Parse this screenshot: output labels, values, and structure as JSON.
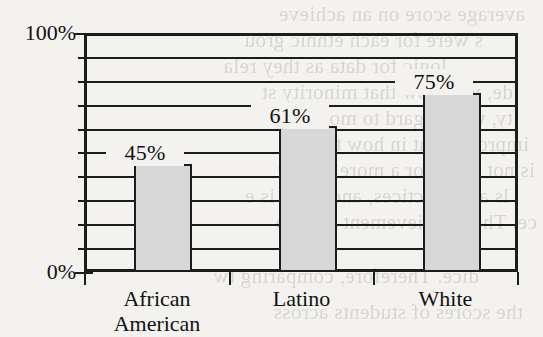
{
  "chart_data": {
    "type": "bar",
    "title": "",
    "subtitle": "",
    "xlabel": "",
    "ylabel": "",
    "categories": [
      "African American",
      "Latino",
      "White"
    ],
    "category_lines": [
      [
        "African",
        "American"
      ],
      [
        "Latino"
      ],
      [
        "White"
      ]
    ],
    "values": [
      45,
      61,
      75
    ],
    "value_labels": [
      "45%",
      "61%",
      "75%"
    ],
    "ylim": [
      0,
      100
    ],
    "ytick_values": [
      0,
      10,
      20,
      30,
      40,
      50,
      60,
      70,
      80,
      90,
      100
    ],
    "ytick_labels_shown": [
      "0%",
      "100%"
    ],
    "y_axis_min_label": "0%",
    "y_axis_max_label": "100%",
    "grid": true,
    "grid_orientation": "horizontal",
    "legend": null,
    "legend_position": "none",
    "series": [
      {
        "name": "Percent",
        "values": [
          45,
          61,
          75
        ]
      }
    ],
    "colors": {
      "bar_fill": "#d7d7d7",
      "bar_border": "#1c1c1c",
      "axis": "#1c1c1c",
      "grid": "#1c1c1c",
      "background": "#f3f2ef",
      "text": "#111111"
    }
  },
  "background_text": {
    "note": "faint bleed-through text from reverse of scanned page",
    "lines": [
      "average score on an achieve",
      "s were for each ethnic grou",
      "logic for data as they rela",
      "de, we know that minority st",
      "ity, with regard to most test",
      "improvement in how they a",
      "is not a new or a more conser",
      "ls and practices, and there is e",
      "ce. Their achievement is follo",
      "dice. Therefore, comparing tw",
      "the scores of students across"
    ]
  }
}
